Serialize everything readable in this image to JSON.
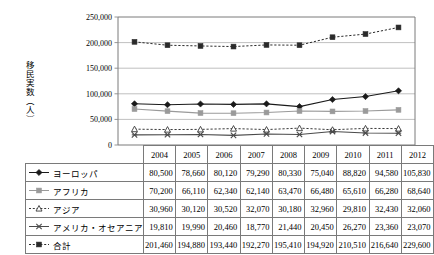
{
  "axis": {
    "y_title": "移民実数（人）",
    "y_ticks": [
      "250,000",
      "200,000",
      "150,000",
      "100,000",
      "50,000",
      "0"
    ]
  },
  "table": {
    "corner_label": "",
    "year_headers": [
      "2004",
      "2005",
      "2006",
      "2007",
      "2008",
      "2009",
      "2010",
      "2011",
      "2012"
    ],
    "rows": [
      {
        "label": "ヨーロッパ",
        "marker": "diamond-marker",
        "values": [
          "80,500",
          "78,660",
          "80,120",
          "79,290",
          "80,330",
          "75,040",
          "88,820",
          "94,580",
          "105,830"
        ]
      },
      {
        "label": "アフリカ",
        "marker": "square-marker",
        "values": [
          "70,200",
          "66,110",
          "62,340",
          "62,140",
          "63,470",
          "66,480",
          "65,610",
          "66,280",
          "68,640"
        ]
      },
      {
        "label": "アジア",
        "marker": "triangle-marker",
        "values": [
          "30,960",
          "30,120",
          "30,520",
          "32,070",
          "30,180",
          "32,960",
          "29,810",
          "32,430",
          "32,060"
        ]
      },
      {
        "label": "アメリカ・オセアニア",
        "marker": "cross-marker",
        "values": [
          "19,810",
          "19,990",
          "20,460",
          "18,770",
          "21,440",
          "20,450",
          "26,270",
          "23,360",
          "23,070"
        ]
      },
      {
        "label": "合計",
        "marker": "square-dotted-marker",
        "values": [
          "201,460",
          "194,880",
          "193,440",
          "192,270",
          "195,410",
          "194,920",
          "210,510",
          "216,640",
          "229,600"
        ]
      }
    ]
  },
  "chart_data": {
    "type": "line",
    "title": "",
    "xlabel": "",
    "ylabel": "移民実数（人）",
    "categories": [
      "2004",
      "2005",
      "2006",
      "2007",
      "2008",
      "2009",
      "2010",
      "2011",
      "2012"
    ],
    "ylim": [
      0,
      250000
    ],
    "ytick_step": 50000,
    "grid": true,
    "legend_position": "table-row-headers",
    "series": [
      {
        "name": "ヨーロッパ",
        "marker": "diamond",
        "line": "solid",
        "color": "#1a1a1a",
        "values": [
          80500,
          78660,
          80120,
          79290,
          80330,
          75040,
          88820,
          94580,
          105830
        ]
      },
      {
        "name": "アフリカ",
        "marker": "square",
        "line": "solid",
        "color": "#9a9a9a",
        "values": [
          70200,
          66110,
          62340,
          62140,
          63470,
          66480,
          65610,
          66280,
          68640
        ]
      },
      {
        "name": "アジア",
        "marker": "triangle",
        "line": "dotted",
        "color": "#3a3a3a",
        "values": [
          30960,
          30120,
          30520,
          32070,
          30180,
          32960,
          29810,
          32430,
          32060
        ]
      },
      {
        "name": "アメリカ・オセアニア",
        "marker": "cross",
        "line": "solid",
        "color": "#4a4a4a",
        "values": [
          19810,
          19990,
          20460,
          18770,
          21440,
          20450,
          26270,
          23360,
          23070
        ]
      },
      {
        "name": "合計",
        "marker": "square",
        "line": "dotted",
        "color": "#2a2a2a",
        "values": [
          201460,
          194880,
          193440,
          192270,
          195410,
          194920,
          210510,
          216640,
          229600
        ]
      }
    ]
  }
}
